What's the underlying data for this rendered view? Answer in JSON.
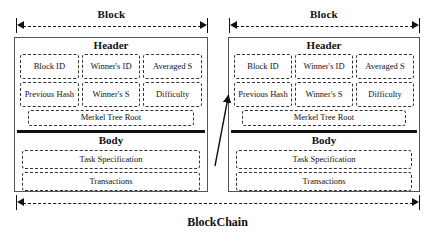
{
  "diagram": {
    "title": "BlockChain",
    "chain_label": "BlockChain",
    "block_label": "Block",
    "header_label": "Header",
    "body_label": "Body",
    "merkel_label": "Merkel Tree Root",
    "colors": {
      "background": "#ffffff",
      "outline": "#555555",
      "dashed": "#333333",
      "text": "#111111",
      "divider": "#111111"
    },
    "blocks": [
      {
        "index": 1,
        "top_label": "Block",
        "header": {
          "title": "Header",
          "fields": [
            "Block ID",
            "Winner's ID",
            "Averaged S",
            "Previous Hash",
            "Winner's S",
            "Difficulty"
          ],
          "merkel_root": "Merkel Tree Root"
        },
        "body": {
          "title": "Body",
          "rows": [
            "Task Specification",
            "Transactions"
          ]
        }
      },
      {
        "index": 2,
        "top_label": "Block",
        "header": {
          "title": "Header",
          "fields": [
            "Block ID",
            "Winner's ID",
            "Averaged S",
            "Previous Hash",
            "Winner's S",
            "Difficulty"
          ],
          "merkel_root": "Merkel Tree Root"
        },
        "body": {
          "title": "Body",
          "rows": [
            "Task Specification",
            "Transactions"
          ]
        }
      }
    ],
    "link": {
      "description": "hash link from previous block to next block's Previous Hash field"
    }
  }
}
